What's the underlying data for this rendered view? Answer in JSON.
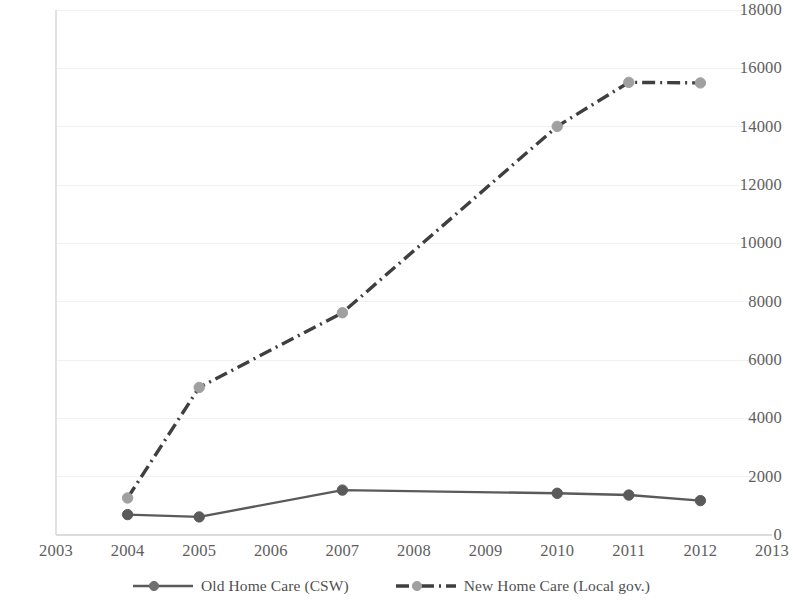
{
  "chart_data": {
    "type": "line",
    "title": "",
    "subtitle": "",
    "xlabel": "",
    "ylabel": "",
    "x": [
      2004,
      2005,
      2007,
      2010,
      2011,
      2012
    ],
    "categories": [
      "2004",
      "2005",
      "2007",
      "2010",
      "2011",
      "2012"
    ],
    "xlim": [
      2003,
      2013
    ],
    "ylim": [
      0,
      18000
    ],
    "ytick_labels": [
      "0",
      "2000",
      "4000",
      "6000",
      "8000",
      "10000",
      "12000",
      "14000",
      "16000",
      "18000"
    ],
    "ytick_values": [
      0,
      2000,
      4000,
      6000,
      8000,
      10000,
      12000,
      14000,
      16000,
      18000
    ],
    "xtick_labels": [
      "2003",
      "2004",
      "2005",
      "2006",
      "2007",
      "2008",
      "2009",
      "2010",
      "2011",
      "2012",
      "2013"
    ],
    "xtick_values": [
      2003,
      2004,
      2005,
      2006,
      2007,
      2008,
      2009,
      2010,
      2011,
      2012,
      2013
    ],
    "grid": "horizontal",
    "legend_position": "bottom",
    "series": [
      {
        "name": "Old Home Care (CSW)",
        "x": [
          2004,
          2005,
          2007,
          2010,
          2011,
          2012
        ],
        "values": [
          700,
          620,
          1540,
          1430,
          1370,
          1180
        ],
        "color": "#5a5a5a",
        "line_style": "solid",
        "marker": "circle"
      },
      {
        "name": "New Home Care (Local gov.)",
        "x": [
          2004,
          2005,
          2007,
          2010,
          2011,
          2012
        ],
        "values": [
          1270,
          5060,
          7620,
          14010,
          15520,
          15500
        ],
        "color": "#3f3f3f",
        "marker_color": "#a0a0a0",
        "line_style": "dash-dot",
        "marker": "circle"
      }
    ]
  },
  "axes": {
    "grid_color": "#f1f1f1",
    "axis_line_color": "#e2e2e2",
    "tick_text_color": "#5e5e5e"
  },
  "legend": {
    "entries": [
      {
        "label": "Old Home Care (CSW)",
        "style": "solid",
        "line_color": "#5a5a5a",
        "marker_color": "#6f6f6f"
      },
      {
        "label": "New Home Care (Local gov.)",
        "style": "dash-dot",
        "line_color": "#3f3f3f",
        "marker_color": "#a0a0a0"
      }
    ]
  }
}
